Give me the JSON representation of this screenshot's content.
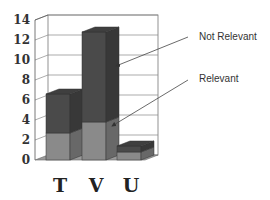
{
  "chart_data": {
    "type": "bar",
    "stacked": true,
    "three_d": true,
    "title": "",
    "xlabel": "",
    "ylabel": "",
    "categories": [
      "T",
      "V",
      "U"
    ],
    "series": [
      {
        "name": "Relevant",
        "values": [
          2.7,
          3.8,
          0.8
        ],
        "color": "#8a8a8a"
      },
      {
        "name": "Not Relevant",
        "values": [
          3.9,
          9.0,
          0.6
        ],
        "color": "#4a4a4a"
      }
    ],
    "totals": [
      6.6,
      12.8,
      1.4
    ],
    "ylim": [
      0,
      14
    ],
    "yticks": [
      "0",
      "2",
      "4",
      "6",
      "8",
      "10",
      "12",
      "14"
    ],
    "grid": true,
    "annotations": [
      {
        "text": "Not Relevant",
        "points_to": "V upper segment"
      },
      {
        "text": "Relevant",
        "points_to": "V lower segment"
      }
    ],
    "legend_position": "none (arrow annotations on right)"
  },
  "labels": {
    "not_relevant": "Not Relevant",
    "relevant": "Relevant"
  }
}
